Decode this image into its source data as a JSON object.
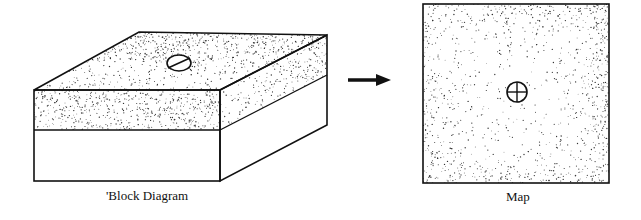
{
  "diagram": {
    "left_figure": {
      "caption": "'Block Diagram",
      "symbol": "strike-and-dip-icon",
      "layers": [
        "stippled-top-layer",
        "white-lower-layer"
      ]
    },
    "arrow": {
      "direction": "right",
      "icon": "right-arrow-icon"
    },
    "right_figure": {
      "caption": "Map",
      "symbol": "horizontal-bed-icon"
    },
    "colors": {
      "ink": "#111111",
      "paper": "#ffffff",
      "stipple": "#333333"
    }
  }
}
